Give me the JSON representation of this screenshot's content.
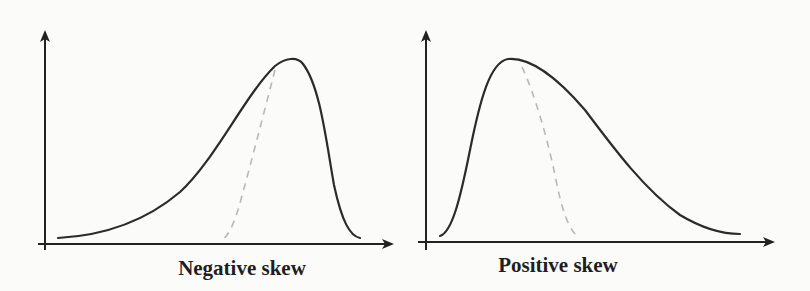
{
  "figure": {
    "panels": [
      {
        "id": "negative",
        "caption": "Negative skew",
        "shape": "left-skewed (long tail to the left, peak toward the right)",
        "has_dashed_reference_curve": true
      },
      {
        "id": "positive",
        "caption": "Positive skew",
        "shape": "right-skewed (long tail to the right, peak toward the left)",
        "has_dashed_reference_curve": true
      }
    ],
    "colors": {
      "background": "#fbfbfa",
      "curve": "#2b2b2b",
      "axis": "#222222",
      "dashed": "#b8b8b8",
      "text": "#1f1f1f"
    }
  }
}
